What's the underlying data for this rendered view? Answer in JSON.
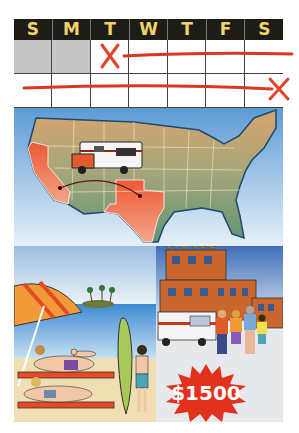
{
  "calendar": {
    "days": [
      "S",
      "M",
      "T",
      "W",
      "T",
      "F",
      "S"
    ],
    "rows": [
      {
        "cells": [
          "gray",
          "gray",
          "x-start",
          "line",
          "line",
          "line",
          "line-end"
        ]
      },
      {
        "cells": [
          "line",
          "line",
          "line",
          "line",
          "line",
          "line",
          "x-end"
        ]
      }
    ],
    "header_color": "#1e1c16",
    "day_label_color": "#f0d36a",
    "mark_color": "#e0442a"
  },
  "map": {
    "highlighted_states": [
      "California",
      "Texas"
    ],
    "route": {
      "from": "Texas",
      "to": "California"
    },
    "vehicle": "rv-camper",
    "land_color": "#6e9a72",
    "highlight_color": "#ee6a3e",
    "water_color": "#7fb0dc"
  },
  "beach": {
    "scene": "beach vacation",
    "elements": [
      "umbrella",
      "island-palms",
      "swimmer",
      "surfboard",
      "sunbathers",
      "boy"
    ]
  },
  "motel": {
    "sign": "MOTEL",
    "elements": [
      "building",
      "rv",
      "family"
    ]
  },
  "price": {
    "label": "$1500",
    "burst_color": "#e2311c"
  }
}
